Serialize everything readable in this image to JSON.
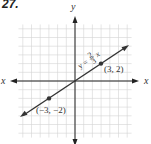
{
  "problem": {
    "number": "27."
  },
  "chart_data": {
    "type": "line",
    "title": "",
    "xlabel": "x",
    "ylabel": "y",
    "xlim": [
      -6.5,
      6.5
    ],
    "ylim": [
      -6.5,
      6.5
    ],
    "grid": true,
    "series": [
      {
        "name": "y = 2/3 x",
        "equation": "y = (2/3)x",
        "slope": 0.6667,
        "intercept": 0,
        "x": [
          -6.3,
          6.2
        ],
        "y": [
          -4.2,
          4.13
        ],
        "arrows": "both"
      }
    ],
    "points": [
      {
        "x": -3,
        "y": -2,
        "label": "(−3, −2)"
      },
      {
        "x": 3,
        "y": 2,
        "label": "(3, 2)"
      }
    ],
    "annotations": [
      {
        "text": "y = 2/3 x",
        "position": "along line, above (1.5, 1)"
      }
    ]
  },
  "labels": {
    "x_left": "x",
    "x_right": "x",
    "y_top": "y",
    "eq_y": "y =",
    "eq_num": "2",
    "eq_den": "3",
    "eq_x": "x",
    "pt1": "(3, 2)",
    "pt2": "(−3, −2)"
  }
}
